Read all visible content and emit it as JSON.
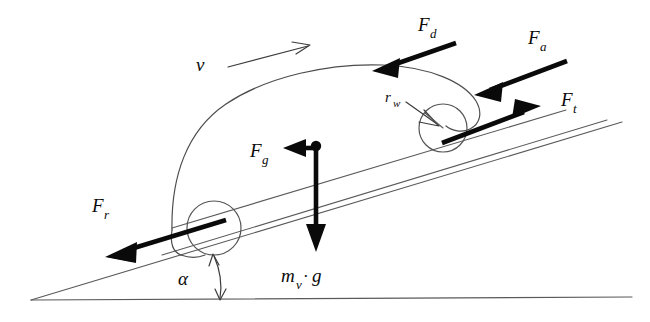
{
  "figure": {
    "kind": "physics-force-diagram",
    "width": 650,
    "height": 322,
    "background_color": "#ffffff",
    "line_color": "#5a5a5a",
    "arrow_color": "#0a0a0a"
  },
  "labels": {
    "velocity": {
      "symbol": "v",
      "subscript": "",
      "name": "vehicle-velocity"
    },
    "drag": {
      "symbol": "F",
      "subscript": "d",
      "name": "aerodynamic-drag-force"
    },
    "acceleration": {
      "symbol": "F",
      "subscript": "a",
      "name": "acceleration-force"
    },
    "traction": {
      "symbol": "F",
      "subscript": "t",
      "name": "traction-force"
    },
    "rolling": {
      "symbol": "F",
      "subscript": "r",
      "name": "rolling-resistance-force"
    },
    "grade": {
      "symbol": "F",
      "subscript": "g",
      "name": "grade-climbing-force"
    },
    "wheel_radius": {
      "symbol": "r",
      "subscript": "w",
      "name": "wheel-radius"
    },
    "weight": {
      "symbol": "m",
      "subscript": "v",
      "operator": "·",
      "term": "g",
      "name": "vehicle-weight"
    },
    "angle": {
      "symbol": "α",
      "subscript": "",
      "name": "road-inclination-angle"
    }
  },
  "forces": [
    {
      "id": "Fd",
      "label": "F_d",
      "direction": "down-left",
      "applied_at": "roof-front",
      "style": "bold"
    },
    {
      "id": "Fa",
      "label": "F_a",
      "direction": "down-left",
      "applied_at": "windshield",
      "style": "bold"
    },
    {
      "id": "Ft",
      "label": "F_t",
      "direction": "up-right",
      "applied_at": "front-wheel-contact",
      "style": "bold"
    },
    {
      "id": "Fr",
      "label": "F_r",
      "direction": "down-left",
      "applied_at": "rear-wheel-center",
      "style": "bold"
    },
    {
      "id": "Fg",
      "label": "F_g",
      "direction": "left",
      "applied_at": "center-of-mass",
      "style": "bold"
    },
    {
      "id": "mvg",
      "label": "m_v·g",
      "direction": "down",
      "applied_at": "center-of-mass",
      "style": "bold"
    },
    {
      "id": "v",
      "label": "v",
      "direction": "up-right",
      "applied_at": "above-roof",
      "style": "thin"
    }
  ]
}
